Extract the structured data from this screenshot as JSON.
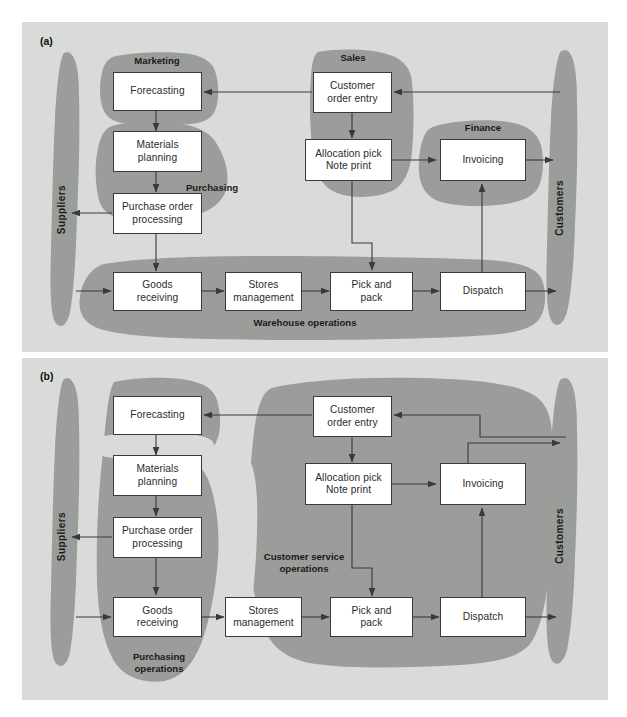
{
  "figure": {
    "panels": [
      {
        "id": "a",
        "letter": "(a)",
        "actors": {
          "left": "Suppliers",
          "right": "Customers"
        },
        "group_labels": [
          "Marketing",
          "Purchasing",
          "Sales",
          "Finance",
          "Warehouse operations"
        ],
        "boxes": [
          {
            "id": "forecasting",
            "line1": "Forecasting",
            "line2": ""
          },
          {
            "id": "materials-planning",
            "line1": "Materials",
            "line2": "planning"
          },
          {
            "id": "purchase-order-processing",
            "line1": "Purchase order",
            "line2": "processing"
          },
          {
            "id": "goods-receiving",
            "line1": "Goods",
            "line2": "receiving"
          },
          {
            "id": "stores-management",
            "line1": "Stores",
            "line2": "management"
          },
          {
            "id": "pick-and-pack",
            "line1": "Pick and",
            "line2": "pack"
          },
          {
            "id": "dispatch",
            "line1": "Dispatch",
            "line2": ""
          },
          {
            "id": "customer-order-entry",
            "line1": "Customer",
            "line2": "order entry"
          },
          {
            "id": "allocation-pick-note-print",
            "line1": "Allocation pick",
            "line2": "Note print"
          },
          {
            "id": "invoicing",
            "line1": "Invoicing",
            "line2": ""
          }
        ]
      },
      {
        "id": "b",
        "letter": "(b)",
        "actors": {
          "left": "Suppliers",
          "right": "Customers"
        },
        "group_labels": [
          "Purchasing operations",
          "Customer service operations"
        ],
        "boxes": [
          {
            "id": "forecasting",
            "line1": "Forecasting",
            "line2": ""
          },
          {
            "id": "materials-planning",
            "line1": "Materials",
            "line2": "planning"
          },
          {
            "id": "purchase-order-processing",
            "line1": "Purchase order",
            "line2": "processing"
          },
          {
            "id": "goods-receiving",
            "line1": "Goods",
            "line2": "receiving"
          },
          {
            "id": "stores-management",
            "line1": "Stores",
            "line2": "management"
          },
          {
            "id": "pick-and-pack",
            "line1": "Pick and",
            "line2": "pack"
          },
          {
            "id": "dispatch",
            "line1": "Dispatch",
            "line2": ""
          },
          {
            "id": "customer-order-entry",
            "line1": "Customer",
            "line2": "order entry"
          },
          {
            "id": "allocation-pick-note-print",
            "line1": "Allocation pick",
            "line2": "Note print"
          },
          {
            "id": "invoicing",
            "line1": "Invoicing",
            "line2": ""
          }
        ]
      }
    ],
    "colors": {
      "panel_background": "#d9dbd8",
      "blob_fill": "#9a9d99",
      "box_fill": "#ffffff",
      "box_border": "#3a3a3a",
      "arrow": "#3a3a3a",
      "text": "#1a1a1a"
    }
  },
  "panel_a": {
    "letter": "(a)",
    "actor_left": "Suppliers",
    "actor_right": "Customers",
    "label_marketing": "Marketing",
    "label_purchasing": "Purchasing",
    "label_sales": "Sales",
    "label_finance": "Finance",
    "label_warehouse": "Warehouse operations",
    "box_forecasting": "Forecasting",
    "box_materials_1": "Materials",
    "box_materials_2": "planning",
    "box_purchase_1": "Purchase order",
    "box_purchase_2": "processing",
    "box_goods_1": "Goods",
    "box_goods_2": "receiving",
    "box_stores_1": "Stores",
    "box_stores_2": "management",
    "box_pick_1": "Pick and",
    "box_pick_2": "pack",
    "box_dispatch": "Dispatch",
    "box_coe_1": "Customer",
    "box_coe_2": "order entry",
    "box_alloc_1": "Allocation pick",
    "box_alloc_2": "Note print",
    "box_invoicing": "Invoicing"
  },
  "panel_b": {
    "letter": "(b)",
    "actor_left": "Suppliers",
    "actor_right": "Customers",
    "label_purchasing_1": "Purchasing",
    "label_purchasing_2": "operations",
    "label_cso_1": "Customer service",
    "label_cso_2": "operations",
    "box_forecasting": "Forecasting",
    "box_materials_1": "Materials",
    "box_materials_2": "planning",
    "box_purchase_1": "Purchase order",
    "box_purchase_2": "processing",
    "box_goods_1": "Goods",
    "box_goods_2": "receiving",
    "box_stores_1": "Stores",
    "box_stores_2": "management",
    "box_pick_1": "Pick and",
    "box_pick_2": "pack",
    "box_dispatch": "Dispatch",
    "box_coe_1": "Customer",
    "box_coe_2": "order entry",
    "box_alloc_1": "Allocation pick",
    "box_alloc_2": "Note print",
    "box_invoicing": "Invoicing"
  }
}
